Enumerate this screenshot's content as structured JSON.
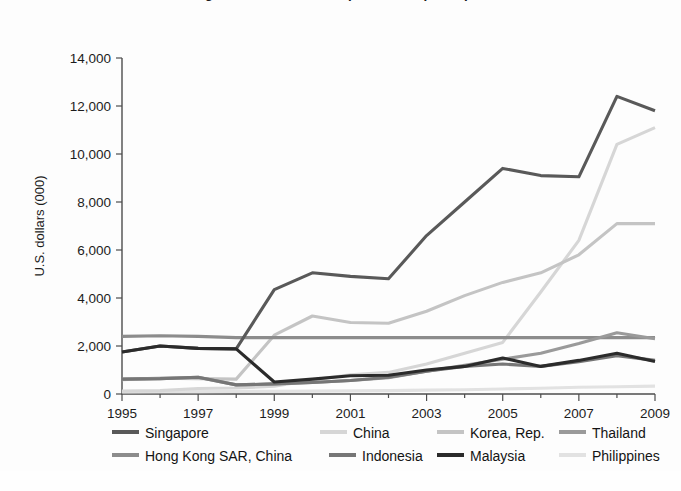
{
  "figure": {
    "title_clipped": "Figure: Stock market capitalization per capita",
    "background": "#fdfdfd"
  },
  "axes": {
    "ylabel": "U.S. dollars (000)",
    "yticks": [
      "0",
      "2,000",
      "4,000",
      "6,000",
      "8,000",
      "10,000",
      "12,000",
      "14,000"
    ],
    "xticks": [
      "1995",
      "1997",
      "1999",
      "2001",
      "2003",
      "2005",
      "2007",
      "2009"
    ],
    "axis_color": "#4d4d4d"
  },
  "legend": {
    "row1": [
      {
        "label": "Singapore",
        "color": "#595959",
        "x": 112
      },
      {
        "label": "China",
        "color": "#d6d6d6",
        "x": 320
      },
      {
        "label": "Korea, Rep.",
        "color": "#c4c4c4",
        "x": 437
      },
      {
        "label": "Thailand",
        "color": "#9a9a9a",
        "x": 559
      }
    ],
    "row2": [
      {
        "label": "Hong Kong SAR, China",
        "color": "#8c8c8c",
        "x": 112
      },
      {
        "label": "Indonesia",
        "color": "#767676",
        "x": 329
      },
      {
        "label": "Malaysia",
        "color": "#2b2b2b",
        "x": 437
      },
      {
        "label": "Philippines",
        "color": "#e2e2e2",
        "x": 559
      }
    ]
  },
  "chart_data": {
    "type": "line",
    "title": "Figure: Stock market capitalization per capita",
    "xlabel": "",
    "ylabel": "U.S. dollars (000)",
    "xlim": [
      1995,
      2009
    ],
    "ylim": [
      0,
      14000
    ],
    "ytick_step": 2000,
    "grid": false,
    "legend_position": "bottom",
    "x": [
      1995,
      1996,
      1997,
      1998,
      1999,
      2000,
      2001,
      2002,
      2003,
      2004,
      2005,
      2006,
      2007,
      2008,
      2009
    ],
    "series": [
      {
        "name": "Singapore",
        "color": "#595959",
        "values": [
          1750,
          2000,
          1900,
          1880,
          4350,
          5050,
          4900,
          4800,
          6600,
          8000,
          9400,
          9100,
          9050,
          12400,
          11800
        ]
      },
      {
        "name": "China",
        "color": "#d6d6d6",
        "values": [
          120,
          140,
          230,
          250,
          320,
          580,
          800,
          900,
          1250,
          1700,
          2150,
          4250,
          6400,
          10400,
          11100
        ]
      },
      {
        "name": "Korea, Rep.",
        "color": "#c4c4c4",
        "values": [
          600,
          660,
          640,
          620,
          2450,
          3250,
          2980,
          2950,
          3450,
          4100,
          4650,
          5050,
          5800,
          7100,
          7100
        ]
      },
      {
        "name": "Thailand",
        "color": "#9a9a9a",
        "values": [
          620,
          640,
          700,
          380,
          420,
          480,
          560,
          680,
          950,
          1200,
          1450,
          1700,
          2100,
          2550,
          2300
        ]
      },
      {
        "name": "Hong Kong SAR, China",
        "color": "#8c8c8c",
        "values": [
          2400,
          2430,
          2400,
          2350,
          2350,
          2350,
          2350,
          2350,
          2350,
          2350,
          2350,
          2350,
          2350,
          2350,
          2350
        ]
      },
      {
        "name": "Indonesia",
        "color": "#767676",
        "values": [
          620,
          640,
          700,
          380,
          420,
          480,
          560,
          700,
          950,
          1150,
          1250,
          1150,
          1350,
          1600,
          1400
        ]
      },
      {
        "name": "Malaysia",
        "color": "#2b2b2b",
        "values": [
          1750,
          2000,
          1900,
          1880,
          500,
          620,
          760,
          780,
          1000,
          1150,
          1500,
          1150,
          1400,
          1700,
          1350
        ]
      },
      {
        "name": "Philippines",
        "color": "#e2e2e2",
        "values": [
          90,
          95,
          100,
          105,
          110,
          120,
          130,
          140,
          160,
          180,
          210,
          240,
          280,
          300,
          330
        ]
      }
    ]
  }
}
